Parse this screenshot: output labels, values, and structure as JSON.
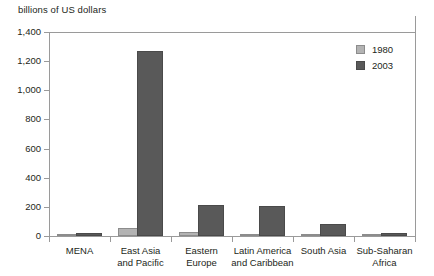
{
  "chart_data": {
    "type": "bar",
    "title": "billions of US dollars",
    "xlabel": "",
    "ylabel": "billions of US dollars",
    "ylim": [
      0,
      1400
    ],
    "yticks": [
      0,
      200,
      400,
      600,
      800,
      1000,
      1200,
      1400
    ],
    "ytick_labels": [
      "0",
      "200",
      "400",
      "600",
      "800",
      "1,000",
      "1,200",
      "1,400"
    ],
    "grid": false,
    "legend_position": "top-right",
    "categories": [
      "MENA",
      "East Asia and Pacific",
      "Eastern Europe",
      "Latin America and Caribbean",
      "South Asia",
      "Sub-Saharan Africa"
    ],
    "category_lines": [
      [
        "MENA"
      ],
      [
        "East Asia",
        "and Pacific"
      ],
      [
        "Eastern",
        "Europe"
      ],
      [
        "Latin America",
        "and Caribbean"
      ],
      [
        "South Asia"
      ],
      [
        "Sub-Saharan",
        "Africa"
      ]
    ],
    "series": [
      {
        "name": "1980",
        "color": "#b3b3b3",
        "values": [
          3,
          55,
          25,
          8,
          10,
          8
        ]
      },
      {
        "name": "2003",
        "color": "#595959",
        "values": [
          20,
          1270,
          210,
          205,
          85,
          22
        ]
      }
    ]
  },
  "legend": {
    "items": [
      {
        "label": "1980",
        "swatch": "legend-swatch-1980"
      },
      {
        "label": "2003",
        "swatch": "legend-swatch-2003"
      }
    ]
  },
  "colors": {
    "series_1980": "#b3b3b3",
    "series_2003": "#595959",
    "axis": "#9a9a9a",
    "text": "#231f20",
    "background": "#ffffff"
  }
}
